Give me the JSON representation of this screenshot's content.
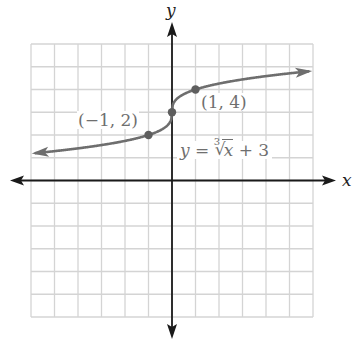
{
  "chart_data": {
    "type": "line",
    "title": "",
    "function": "y = cbrt(x) + 3",
    "equation_label": {
      "lhs": "y",
      "eq": "=",
      "index": "3",
      "radicand": "x",
      "rest": "+ 3"
    },
    "xlabel": "x",
    "ylabel": "y",
    "xlim": [
      -6,
      6
    ],
    "ylim": [
      -6,
      6
    ],
    "grid": true,
    "grid_step": 1,
    "tick_labels": false,
    "series": [
      {
        "name": "y = ∛x + 3",
        "color": "#6e6e6e",
        "x": [
          -6,
          -5,
          -4,
          -3,
          -2,
          -1,
          -0.5,
          -0.125,
          0,
          0.125,
          0.5,
          1,
          2,
          3,
          4,
          5,
          6
        ],
        "y": [
          1.18,
          1.29,
          1.41,
          1.56,
          1.74,
          2,
          2.21,
          2.5,
          3,
          3.5,
          3.79,
          4,
          4.26,
          4.44,
          4.59,
          4.71,
          4.82
        ],
        "arrows": "both"
      }
    ],
    "points": [
      {
        "x": -1,
        "y": 2,
        "label": "(−1, 2)"
      },
      {
        "x": 0,
        "y": 3,
        "label": ""
      },
      {
        "x": 1,
        "y": 4,
        "label": "(1, 4)"
      }
    ],
    "colors": {
      "grid": "#d4d4d4",
      "axis": "#1a1a1a",
      "curve": "#6e6e6e",
      "text": "#6f6f6f"
    }
  },
  "labels": {
    "point_neg": "(−1, 2)",
    "point_pos": "(1, 4)",
    "y_axis": "y",
    "x_axis": "x"
  }
}
